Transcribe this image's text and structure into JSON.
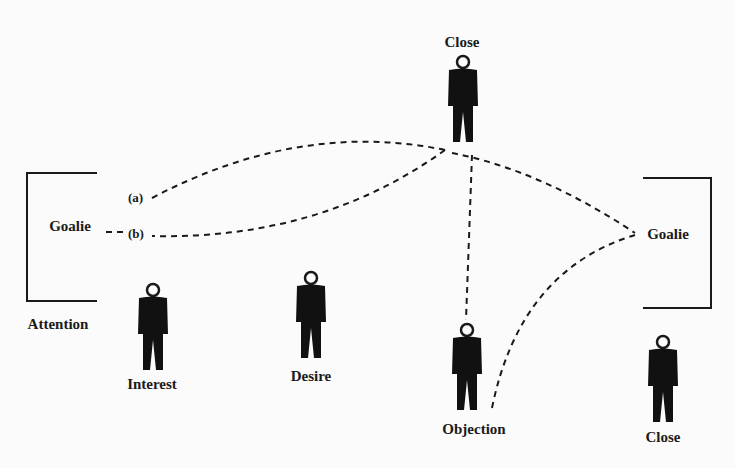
{
  "diagram": {
    "title": "",
    "goals": {
      "left": {
        "label": "Goalie",
        "stage": "Attention"
      },
      "right": {
        "label": "Goalie"
      }
    },
    "paths": {
      "a_label": "(a)",
      "b_label": "(b)"
    },
    "players": [
      {
        "id": "interest",
        "label": "Interest"
      },
      {
        "id": "desire",
        "label": "Desire"
      },
      {
        "id": "close-top",
        "label": "Close"
      },
      {
        "id": "objection",
        "label": "Objection"
      },
      {
        "id": "close-right",
        "label": "Close"
      }
    ],
    "colors": {
      "ink": "#1a1a1a",
      "background": "#fbfbfb"
    }
  }
}
